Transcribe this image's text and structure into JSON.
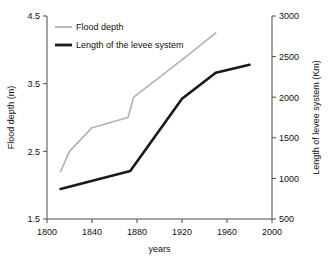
{
  "chart_data": {
    "type": "line",
    "title": "",
    "xlabel": "years",
    "ylabel": "Flood depth (m)",
    "y2label": "Length of levee system (Km)",
    "xlim": [
      1800,
      2000
    ],
    "ylim": [
      1.5,
      4.5
    ],
    "y2lim": [
      500,
      3000
    ],
    "xticks": [
      1800,
      1840,
      1880,
      1920,
      1960,
      2000
    ],
    "xtick_labels": [
      "1800",
      "1840",
      "1880",
      "1920",
      "1960",
      "2000"
    ],
    "yticks": [
      1.5,
      2.5,
      3.5,
      4.5
    ],
    "ytick_labels": [
      "1.5",
      "2.5",
      "3.5",
      "4.5"
    ],
    "y2ticks": [
      500,
      1000,
      1500,
      2000,
      2500,
      3000
    ],
    "y2tick_labels": [
      "500",
      "1000",
      "1500",
      "2000",
      "2500",
      "3000"
    ],
    "grid": false,
    "legend_position": "top-left",
    "series": [
      {
        "name": "Flood depth",
        "axis": "left",
        "color": "#b2b2b2",
        "width": 1.6,
        "x": [
          1812,
          1820,
          1840,
          1872,
          1877,
          1920,
          1950
        ],
        "values": [
          2.2,
          2.5,
          2.85,
          3.0,
          3.3,
          3.85,
          4.25
        ]
      },
      {
        "name": "Length of the levee system",
        "axis": "right",
        "color": "#1a1a1a",
        "width": 2.6,
        "x": [
          1812,
          1874,
          1920,
          1950,
          1980
        ],
        "values": [
          870,
          1090,
          1980,
          2300,
          2400
        ]
      }
    ]
  },
  "legend": {
    "items": [
      {
        "label": "Flood depth",
        "color": "#b2b2b2"
      },
      {
        "label": "Length of the levee system",
        "color": "#1a1a1a"
      }
    ]
  }
}
